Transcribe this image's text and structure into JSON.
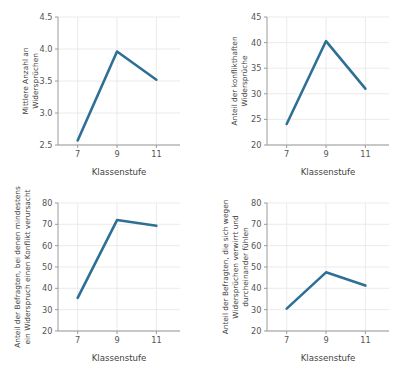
{
  "figure": {
    "background_color": "#ffffff",
    "line_color": "#2e7095",
    "grid_color": "#e9e9e9",
    "spine_color": "#9a9a9a",
    "panel_count": 4
  },
  "chart_data": [
    {
      "id": "panel-top-left",
      "type": "line",
      "title": "",
      "xlabel": "Klassenstufe",
      "ylabel": "Mittlere Anzahl an\nWidersprüchen",
      "ylabel_lines": [
        "Mittlere Anzahl an",
        "Widersprüchen"
      ],
      "x": [
        7,
        9,
        11
      ],
      "xticklabels": [
        "7",
        "9",
        "11"
      ],
      "values": [
        2.57,
        3.96,
        3.52
      ],
      "yticks": [
        2.5,
        3.0,
        3.5,
        4.0,
        4.5
      ],
      "yticklabels": [
        "2.5",
        "3.0",
        "3.5",
        "4.0",
        "4.5"
      ],
      "ylim": [
        2.5,
        4.5
      ],
      "xlim": [
        6.0,
        12.2
      ],
      "grid": true,
      "legend": "none",
      "series": [
        {
          "name": "Mittlere Anzahl an Widersprüchen",
          "values": [
            2.57,
            3.96,
            3.52
          ]
        }
      ]
    },
    {
      "id": "panel-top-right",
      "type": "line",
      "title": "",
      "xlabel": "Klassenstufe",
      "ylabel": "Anteil der konflikthaften\nWidersprüche",
      "ylabel_lines": [
        "Anteil der konflikthaften",
        "Widersprüche"
      ],
      "x": [
        7,
        9,
        11
      ],
      "xticklabels": [
        "7",
        "9",
        "11"
      ],
      "values": [
        24.1,
        40.3,
        31.0
      ],
      "yticks": [
        20,
        25,
        30,
        35,
        40,
        45
      ],
      "yticklabels": [
        "20",
        "25",
        "30",
        "35",
        "40",
        "45"
      ],
      "ylim": [
        20,
        45
      ],
      "xlim": [
        6.0,
        12.2
      ],
      "grid": true,
      "legend": "none",
      "series": [
        {
          "name": "Anteil der konflikthaften Widersprüche",
          "values": [
            24.1,
            40.3,
            31.0
          ]
        }
      ]
    },
    {
      "id": "panel-bottom-left",
      "type": "line",
      "title": "",
      "xlabel": "Klassenstufe",
      "ylabel": "Anteil der Befragten, bei denen mindestens\nein Widerspruch einen Konflikt verursacht",
      "ylabel_lines": [
        "Anteil der Befragten, bei denen mindestens",
        "ein Widerspruch einen Konflikt verursacht"
      ],
      "x": [
        7,
        9,
        11
      ],
      "xticklabels": [
        "7",
        "9",
        "11"
      ],
      "values": [
        35.5,
        72.0,
        69.3
      ],
      "yticks": [
        20,
        30,
        40,
        50,
        60,
        70,
        80
      ],
      "yticklabels": [
        "20",
        "30",
        "40",
        "50",
        "60",
        "70",
        "80"
      ],
      "ylim": [
        20,
        80
      ],
      "xlim": [
        6.0,
        12.2
      ],
      "grid": true,
      "legend": "none",
      "series": [
        {
          "name": "Anteil der Befragten mit mindestens einem Konflikt",
          "values": [
            35.5,
            72.0,
            69.3
          ]
        }
      ]
    },
    {
      "id": "panel-bottom-right",
      "type": "line",
      "title": "",
      "xlabel": "Klassenstufe",
      "ylabel": "Anteil der Befragten, die sich wegen\nWidersprüchen verwirrt und\ndurcheinander fühlen",
      "ylabel_lines": [
        "Anteil der Befragten, die sich wegen",
        "Widersprüchen verwirrt und",
        "durcheinander fühlen"
      ],
      "x": [
        7,
        9,
        11
      ],
      "xticklabels": [
        "7",
        "9",
        "11"
      ],
      "values": [
        30.5,
        47.5,
        41.3
      ],
      "yticks": [
        20,
        30,
        40,
        50,
        60,
        70,
        80
      ],
      "yticklabels": [
        "20",
        "30",
        "40",
        "50",
        "60",
        "70",
        "80"
      ],
      "ylim": [
        20,
        80
      ],
      "xlim": [
        6.0,
        12.2
      ],
      "grid": true,
      "legend": "none",
      "series": [
        {
          "name": "Anteil der Befragten, die sich verwirrt fühlen",
          "values": [
            30.5,
            47.5,
            41.3
          ]
        }
      ]
    }
  ]
}
